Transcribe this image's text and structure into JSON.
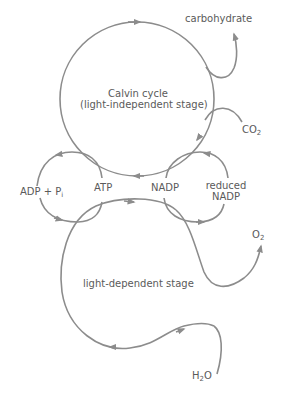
{
  "diagram": {
    "colors": {
      "line": "#8c8c8c",
      "text": "#5a5a5a",
      "background": "#ffffff"
    },
    "nodes": {
      "calvin": {
        "line1": "Calvin cycle",
        "line2": "(light-independent stage)"
      },
      "light": {
        "label": "light-dependent stage"
      },
      "carbohydrate": "carbohydrate",
      "co2": {
        "base": "CO",
        "sub": "2"
      },
      "adp": {
        "base": "ADP + P",
        "sub": "i"
      },
      "atp": "ATP",
      "nadp": "NADP",
      "reduced_nadp": {
        "line1": "reduced",
        "line2": "NADP"
      },
      "o2": {
        "base": "O",
        "sub": "2"
      },
      "h2o": {
        "base1": "H",
        "sub": "2",
        "base2": "O"
      }
    },
    "edges": [
      {
        "from": "co2",
        "to": "calvin"
      },
      {
        "from": "calvin",
        "to": "carbohydrate"
      },
      {
        "from": "atp",
        "to": "adp",
        "via": "calvin"
      },
      {
        "from": "adp",
        "to": "atp",
        "via": "light"
      },
      {
        "from": "reduced_nadp",
        "to": "nadp",
        "via": "calvin"
      },
      {
        "from": "nadp",
        "to": "reduced_nadp",
        "via": "light"
      },
      {
        "from": "h2o",
        "to": "light"
      },
      {
        "from": "light",
        "to": "o2"
      }
    ]
  }
}
